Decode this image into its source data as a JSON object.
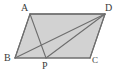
{
  "figure": {
    "kind": "geometry-diagram",
    "shape_name": "parallelogram",
    "background_color": "#ffffff",
    "fill_color": "#d2d2d2",
    "stroke_color": "#6e6e6e",
    "label_color": "#3a3a3a",
    "canvas": {
      "width": 120,
      "height": 72
    },
    "vertices": [
      {
        "id": "A",
        "label": "A",
        "x": 30,
        "y": 14
      },
      {
        "id": "D",
        "label": "D",
        "x": 105,
        "y": 14
      },
      {
        "id": "B",
        "label": "B",
        "x": 15,
        "y": 58
      },
      {
        "id": "P",
        "label": "P",
        "x": 46,
        "y": 58
      },
      {
        "id": "C",
        "label": "C",
        "x": 90,
        "y": 58
      }
    ],
    "outline_points": "30,14 105,14 90,58 15,58",
    "segments": [
      {
        "id": "AB",
        "from": "A",
        "to": "B",
        "x1": 30,
        "y1": 14,
        "x2": 15,
        "y2": 58
      },
      {
        "id": "AD",
        "from": "A",
        "to": "D",
        "x1": 30,
        "y1": 14,
        "x2": 105,
        "y2": 14
      },
      {
        "id": "DC",
        "from": "D",
        "to": "C",
        "x1": 105,
        "y1": 14,
        "x2": 90,
        "y2": 58
      },
      {
        "id": "BC",
        "from": "B",
        "to": "C",
        "x1": 15,
        "y1": 58,
        "x2": 90,
        "y2": 58
      },
      {
        "id": "AP",
        "from": "A",
        "to": "P",
        "x1": 30,
        "y1": 14,
        "x2": 46,
        "y2": 58
      },
      {
        "id": "BD",
        "from": "B",
        "to": "D",
        "x1": 15,
        "y1": 58,
        "x2": 105,
        "y2": 14
      },
      {
        "id": "PD",
        "from": "P",
        "to": "D",
        "x1": 46,
        "y1": 58,
        "x2": 105,
        "y2": 14
      }
    ]
  }
}
